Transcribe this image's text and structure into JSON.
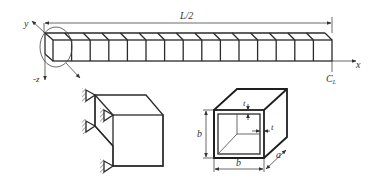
{
  "figure": {
    "beam": {
      "length_label": "L/2",
      "segments": 15,
      "axes": {
        "x": "x",
        "y": "y",
        "z": "-z"
      },
      "centerline_label": "C",
      "centerline_sub": "L"
    },
    "detail_support": {
      "supports": 4
    },
    "cross_section": {
      "height_label": "b",
      "width_label": "b",
      "depth_label": "a",
      "thickness_top": "t",
      "thickness_side": "t"
    }
  }
}
